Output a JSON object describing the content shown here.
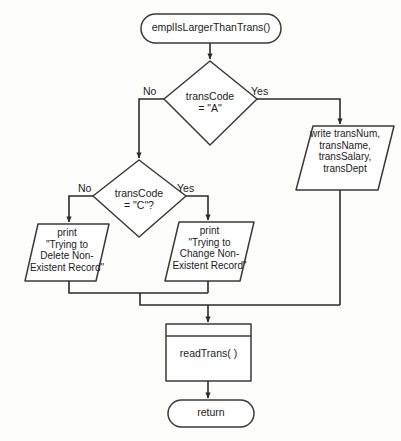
{
  "diagram": {
    "type": "flowchart",
    "stroke_color": "#3a3a3a",
    "fill_color": "#ffffff",
    "text_color": "#1b1b1b",
    "background_color": "#fdfdfc"
  },
  "nodes": {
    "start": {
      "shape": "terminator",
      "label": "emplIsLargerThanTrans()"
    },
    "decision_a": {
      "shape": "decision",
      "label": "transCode\n= \"A\""
    },
    "write_trans": {
      "shape": "io-parallelogram",
      "label": "write transNum,\ntransName,\ntransSalary,\ntransDept"
    },
    "decision_c": {
      "shape": "decision",
      "label": "transCode\n= \"C\"?"
    },
    "print_delete": {
      "shape": "io-parallelogram",
      "label": "print\n\"Trying to\nDelete Non-\nExistent Record\""
    },
    "print_change": {
      "shape": "io-parallelogram",
      "label": "print\n\"Trying to\nChange Non-\nExistent Record\""
    },
    "read_trans": {
      "shape": "predefined-process",
      "label": "readTrans( )"
    },
    "end": {
      "shape": "terminator",
      "label": "return"
    }
  },
  "edge_labels": {
    "a_no": "No",
    "a_yes": "Yes",
    "c_no": "No",
    "c_yes": "Yes"
  }
}
